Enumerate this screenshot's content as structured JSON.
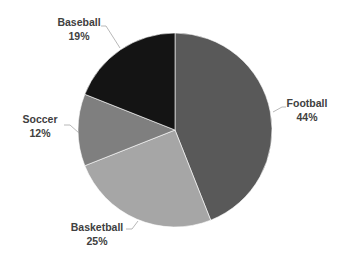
{
  "chart_data": {
    "type": "pie",
    "title": "",
    "start_angle_deg": 0,
    "direction": "clockwise",
    "categories": [
      "Football",
      "Basketball",
      "Soccer",
      "Baseball"
    ],
    "values": [
      44,
      25,
      12,
      19
    ],
    "value_suffix": "%",
    "colors": [
      "#595959",
      "#a6a6a6",
      "#7f7f7f",
      "#141414"
    ],
    "legend": "none",
    "data_labels": "outside with leader lines",
    "labels": [
      {
        "name": "Football",
        "value_text": "44%",
        "x": 307,
        "y": 107,
        "leader": [
          [
            273,
            112
          ],
          [
            282,
            107
          ],
          [
            286,
            107
          ]
        ]
      },
      {
        "name": "Basketball",
        "value_text": "25%",
        "x": 97,
        "y": 231,
        "leader": [
          [
            138,
            221
          ],
          [
            132,
            229
          ],
          [
            126,
            229
          ]
        ]
      },
      {
        "name": "Soccer",
        "value_text": "12%",
        "x": 40,
        "y": 123,
        "leader": [
          [
            79,
            133
          ],
          [
            70,
            125
          ],
          [
            64,
            125
          ]
        ]
      },
      {
        "name": "Baseball",
        "value_text": "19%",
        "x": 79,
        "y": 26,
        "leader": [
          [
            120,
            48
          ],
          [
            106,
            26
          ],
          [
            101,
            26
          ]
        ]
      }
    ]
  },
  "layout": {
    "cx": 175,
    "cy": 130,
    "r": 97
  }
}
